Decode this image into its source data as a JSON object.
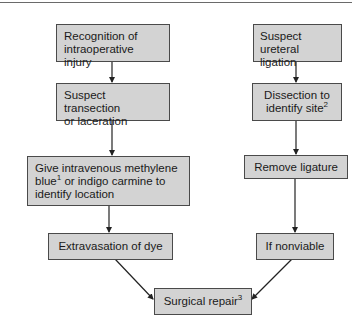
{
  "flowchart": {
    "left_branch": {
      "recognition": "Recognition of intraoperative injury",
      "recognition_lines": [
        "Recognition of",
        "intraoperative injury"
      ],
      "suspect_transection_lines": [
        "Suspect transection",
        "or laceration"
      ],
      "give_iv_lines": [
        "Give intravenous methylene",
        "blue",
        "1",
        " or indigo carmine to",
        "identify location"
      ],
      "extravasation": "Extravasation of dye"
    },
    "right_branch": {
      "suspect_ligation_lines": [
        "Suspect",
        "ureteral ligation"
      ],
      "dissection_lines": [
        "Dissection to",
        "identify site",
        "2"
      ],
      "remove_ligature": "Remove ligature",
      "if_nonviable": "If nonviable"
    },
    "outcome": {
      "surgical_repair": "Surgical repair",
      "surgical_repair_sup": "3"
    },
    "colors": {
      "box_fill": "#d3d3d3",
      "box_border": "#4a4a4a",
      "arrow": "#222222"
    }
  }
}
